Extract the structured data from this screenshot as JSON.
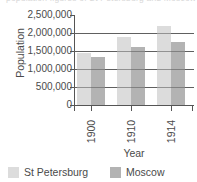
{
  "caption": {
    "text": "population figures of St Petersburg and Moscow"
  },
  "chart_data": {
    "type": "bar",
    "title": "",
    "subtitle": "",
    "xlabel": "Year",
    "ylabel": "Population",
    "categories": [
      "1900",
      "1910",
      "1914"
    ],
    "series": [
      {
        "name": "St Petersburg",
        "color": "#dcdcdc",
        "values": [
          1450000,
          1900000,
          2200000
        ]
      },
      {
        "name": "Moscow",
        "color": "#b3b3b3",
        "values": [
          1330000,
          1620000,
          1750000
        ]
      }
    ],
    "ylim": [
      0,
      2500000
    ],
    "ytick_values": [
      0,
      500000,
      1000000,
      1500000,
      2000000,
      2500000
    ],
    "ytick_labels": [
      "0",
      "500,000",
      "1,000,000",
      "1,500,000",
      "2,000,000",
      "2,500,000"
    ],
    "grid": true,
    "gridline_values": [
      500000,
      1000000,
      1500000,
      2000000
    ],
    "legend_position": "bottom",
    "legend": [
      "St Petersburg",
      "Moscow"
    ]
  },
  "axis": {
    "y_title": "Population",
    "x_title": "Year"
  },
  "legend": {
    "entries": [
      {
        "label": "St Petersburg",
        "color": "#dcdcdc"
      },
      {
        "label": "Moscow",
        "color": "#b3b3b3"
      }
    ]
  }
}
